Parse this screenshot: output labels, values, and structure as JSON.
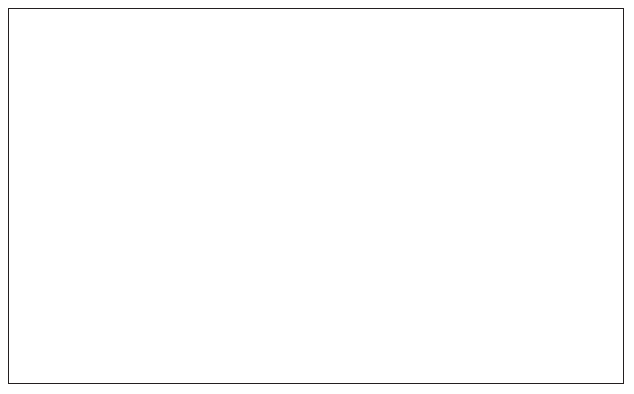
{
  "figure": {
    "border_color": "#231f20",
    "background": "#ffffff"
  },
  "chart_data": {
    "type": "bar",
    "title": "",
    "subtitle": "",
    "xlabel": "",
    "grid": "horizontal",
    "legend": "none",
    "axes": {
      "x": {
        "label": "",
        "min": 1930,
        "max": 2011,
        "ticks": [
          1930,
          1950,
          1970,
          1990,
          2010
        ],
        "tick_labels": [
          "1930",
          "1950",
          "1970",
          "1990",
          "2010"
        ],
        "minor_tick_interval": 10
      },
      "y_left": {
        "label": "Discovery Gb/a",
        "color": "#000000",
        "min": 0.0,
        "max": 1.0,
        "ticks": [
          0.0,
          0.2,
          0.4,
          0.6,
          0.8,
          1.0
        ],
        "tick_labels": [
          "0.0",
          "0.2",
          "0.4",
          "0.6",
          "0.8",
          "1.0"
        ]
      },
      "y_right": {
        "label": "Production Gb/a",
        "color": "#e8432b",
        "min": 0.0,
        "max": 0.15,
        "ticks": [
          0.0,
          0.05,
          0.1,
          0.15
        ],
        "tick_labels": [
          "0.00",
          "0.05",
          "0.10",
          "0.15"
        ]
      }
    },
    "series": [
      {
        "name": "Discovery Gb/a",
        "type": "bar",
        "axis": "y_left",
        "color": "#000000",
        "x": [
          1930,
          1931,
          1932,
          1933,
          1934,
          1935,
          1936,
          1937,
          1938,
          1939,
          1940,
          1941,
          1942,
          1943,
          1944,
          1945,
          1946,
          1947,
          1948,
          1949,
          1950,
          1951,
          1952,
          1953,
          1954,
          1955,
          1956,
          1957,
          1958,
          1959,
          1960,
          1961,
          1962,
          1963,
          1964,
          1965,
          1966,
          1967,
          1968,
          1969,
          1970,
          1971,
          1972,
          1973,
          1974,
          1975,
          1976,
          1977,
          1978,
          1979,
          1980,
          1981,
          1982,
          1983,
          1984,
          1985,
          1986,
          1987,
          1988,
          1989,
          1990,
          1991,
          1992,
          1993,
          1994,
          1995,
          1996,
          1997,
          1998,
          1999,
          2000,
          2001,
          2002,
          2003,
          2004,
          2005,
          2006,
          2007,
          2008,
          2009,
          2010
        ],
        "values": [
          0.0,
          0.0,
          0.0,
          0.0,
          0.0,
          0.0,
          0.0,
          0.0,
          0.0,
          0.0,
          0.0,
          0.0,
          0.0,
          0.0,
          0.0,
          0.0,
          0.0,
          0.0,
          0.0,
          0.0,
          0.0,
          0.0,
          0.0,
          0.0,
          0.0,
          0.02,
          0.0,
          0.01,
          0.01,
          0.01,
          0.02,
          0.01,
          0.23,
          0.01,
          0.01,
          0.02,
          0.11,
          0.24,
          0.26,
          0.33,
          0.31,
          0.03,
          0.09,
          0.04,
          0.22,
          0.08,
          0.07,
          0.04,
          0.05,
          0.05,
          0.19,
          0.07,
          0.04,
          0.07,
          0.04,
          0.05,
          0.06,
          0.03,
          0.94,
          0.14,
          0.11,
          0.19,
          0.07,
          0.05,
          0.02,
          0.02,
          0.04,
          0.03,
          0.11,
          0.08,
          0.08,
          0.05,
          0.05,
          0.02,
          0.01,
          0.04,
          0.16,
          0.08,
          0.03,
          0.03,
          0.04
        ]
      },
      {
        "name": "Production Gb/a",
        "type": "line",
        "axis": "y_right",
        "color": "#e8432b",
        "marker": "diamond",
        "x": [
          1930,
          1931,
          1932,
          1933,
          1934,
          1935,
          1936,
          1937,
          1938,
          1939,
          1940,
          1941,
          1942,
          1943,
          1944,
          1945,
          1946,
          1947,
          1948,
          1949,
          1950,
          1951,
          1952,
          1953,
          1954,
          1955,
          1956,
          1957,
          1958,
          1959,
          1960,
          1961,
          1962,
          1963,
          1964,
          1965,
          1966,
          1967,
          1968,
          1969,
          1970,
          1971,
          1972,
          1973,
          1974,
          1975,
          1976,
          1977,
          1978,
          1979,
          1980,
          1981,
          1982,
          1983,
          1984,
          1985,
          1986,
          1987,
          1988,
          1989,
          1990,
          1991,
          1992,
          1993,
          1994,
          1995,
          1996,
          1997,
          1998,
          1999,
          2000,
          2001,
          2002,
          2003,
          2004,
          2005,
          2006,
          2007,
          2008,
          2009,
          2010
        ],
        "values": [
          0.001,
          0.001,
          0.001,
          0.001,
          0.001,
          0.001,
          0.001,
          0.001,
          0.001,
          0.001,
          0.001,
          0.001,
          0.001,
          0.001,
          0.001,
          0.001,
          0.001,
          0.001,
          0.001,
          0.002,
          0.002,
          0.002,
          0.002,
          0.002,
          0.002,
          0.003,
          0.003,
          0.004,
          0.005,
          0.006,
          0.007,
          0.008,
          0.01,
          0.012,
          0.015,
          0.018,
          0.022,
          0.027,
          0.032,
          0.038,
          0.047,
          0.052,
          0.059,
          0.075,
          0.08,
          0.081,
          0.079,
          0.076,
          0.072,
          0.068,
          0.064,
          0.059,
          0.057,
          0.057,
          0.057,
          0.056,
          0.058,
          0.062,
          0.059,
          0.058,
          0.068,
          0.08,
          0.088,
          0.095,
          0.103,
          0.11,
          0.12,
          0.13,
          0.134,
          0.134,
          0.133,
          0.128,
          0.118,
          0.106,
          0.096,
          0.089,
          0.086,
          0.085,
          0.095,
          0.088,
          0.083
        ]
      }
    ]
  }
}
